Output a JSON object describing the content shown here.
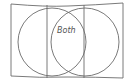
{
  "diagram": {
    "type": "venn",
    "labels": {
      "intersection": "Both"
    },
    "stroke_color": "#6b6b6b",
    "background": "#ffffff"
  }
}
